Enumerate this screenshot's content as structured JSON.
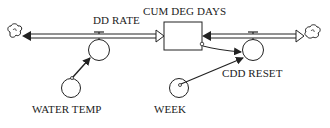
{
  "diagram": {
    "type": "stock-and-flow",
    "stock": {
      "label": "CUM DEG DAYS"
    },
    "flows": [
      {
        "label": "DD RATE",
        "direction": "source-to-stock"
      },
      {
        "label": "CDD RESET",
        "direction": "stock-to-sink"
      }
    ],
    "auxiliaries": [
      {
        "label": "WATER TEMP"
      },
      {
        "label": "WEEK"
      }
    ],
    "links": [
      {
        "from": "WATER TEMP",
        "to": "DD RATE"
      },
      {
        "from": "CUM DEG DAYS",
        "to": "CDD RESET"
      },
      {
        "from": "WEEK",
        "to": "CDD RESET"
      }
    ],
    "clouds": [
      {
        "position": "left"
      },
      {
        "position": "right"
      }
    ],
    "colors": {
      "line": "#222222",
      "background": "#ffffff"
    }
  }
}
